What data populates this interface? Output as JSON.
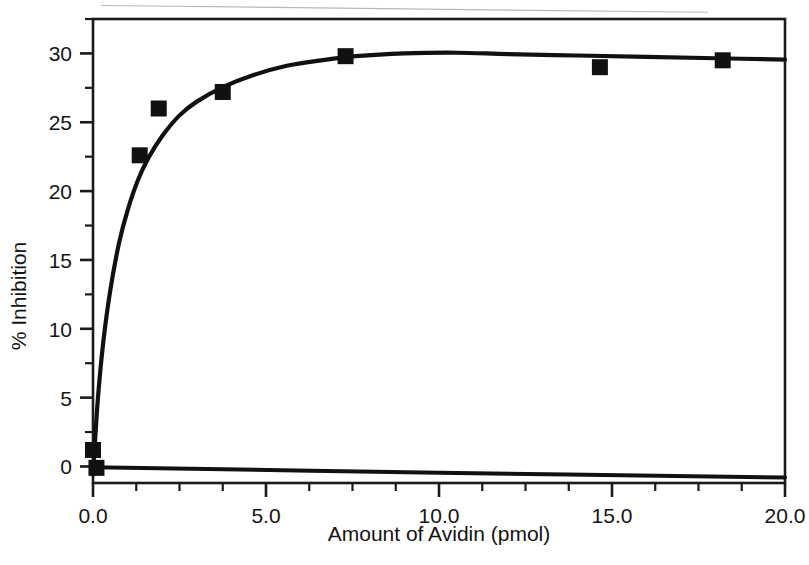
{
  "figure": {
    "background_color": "#ffffff",
    "ink_color": "#111111",
    "frame_color": "#1a1a1a",
    "artifact_color": "#b9b9b9"
  },
  "chart_data": {
    "type": "scatter",
    "title": "",
    "subtitle": "",
    "xlabel": "Amount of Avidin (pmol)",
    "ylabel": "% Inhibition",
    "xlim": [
      0.0,
      20.0
    ],
    "ylim": [
      -1.2,
      32.5
    ],
    "grid": false,
    "legend": null,
    "x_tick_labels": [
      "0.0",
      "5.0",
      "10.0",
      "15.0",
      "20.0"
    ],
    "x_tick_values": [
      0.0,
      5.0,
      10.0,
      15.0,
      20.0
    ],
    "x_minor_tick_values": [
      1.25,
      2.5,
      3.75,
      6.25,
      7.5,
      8.75,
      11.25,
      12.5,
      13.75,
      16.25,
      17.5,
      18.75
    ],
    "y_tick_labels": [
      "0",
      "5",
      "10",
      "15",
      "20",
      "25",
      "30"
    ],
    "y_tick_values": [
      0,
      5,
      10,
      15,
      20,
      25,
      30
    ],
    "y_minor_tick_values": [
      2.5,
      7.5,
      12.5,
      17.5,
      22.5,
      27.5,
      32.5
    ],
    "marker": "filled-square",
    "marker_size_px": 16,
    "series": [
      {
        "name": "% Inhibition vs Avidin",
        "points": [
          {
            "x": 0.0,
            "y": 1.2
          },
          {
            "x": 0.1,
            "y": -0.1
          },
          {
            "x": 1.35,
            "y": 22.6
          },
          {
            "x": 1.9,
            "y": 26.0
          },
          {
            "x": 3.75,
            "y": 27.2
          },
          {
            "x": 7.3,
            "y": 29.8
          },
          {
            "x": 14.65,
            "y": 29.0
          },
          {
            "x": 18.2,
            "y": 29.5
          }
        ]
      }
    ],
    "fit_curve": {
      "name": "saturation fit",
      "model": "rectangular-hyperbola-with-slight-decay",
      "vmax": 30.1,
      "km": 0.72,
      "y_at_zero": -0.4,
      "points": [
        {
          "x": 0.0,
          "y": -0.6
        },
        {
          "x": 0.05,
          "y": 1.5
        },
        {
          "x": 0.15,
          "y": 5.2
        },
        {
          "x": 0.3,
          "y": 9.1
        },
        {
          "x": 0.5,
          "y": 12.8
        },
        {
          "x": 0.75,
          "y": 16.2
        },
        {
          "x": 1.0,
          "y": 18.6
        },
        {
          "x": 1.3,
          "y": 20.8
        },
        {
          "x": 1.6,
          "y": 22.4
        },
        {
          "x": 2.0,
          "y": 24.0
        },
        {
          "x": 2.5,
          "y": 25.5
        },
        {
          "x": 3.0,
          "y": 26.5
        },
        {
          "x": 3.8,
          "y": 27.6
        },
        {
          "x": 4.6,
          "y": 28.4
        },
        {
          "x": 5.6,
          "y": 29.1
        },
        {
          "x": 6.6,
          "y": 29.5
        },
        {
          "x": 7.6,
          "y": 29.8
        },
        {
          "x": 9.0,
          "y": 30.0
        },
        {
          "x": 10.5,
          "y": 30.05
        },
        {
          "x": 12.0,
          "y": 29.95
        },
        {
          "x": 14.0,
          "y": 29.85
        },
        {
          "x": 16.0,
          "y": 29.75
        },
        {
          "x": 18.0,
          "y": 29.65
        },
        {
          "x": 20.0,
          "y": 29.55
        }
      ]
    },
    "baseline_curve": {
      "name": "zero baseline",
      "points": [
        {
          "x": 0.0,
          "y": -0.05
        },
        {
          "x": 10.0,
          "y": -0.45
        },
        {
          "x": 20.0,
          "y": -0.8
        }
      ]
    }
  }
}
